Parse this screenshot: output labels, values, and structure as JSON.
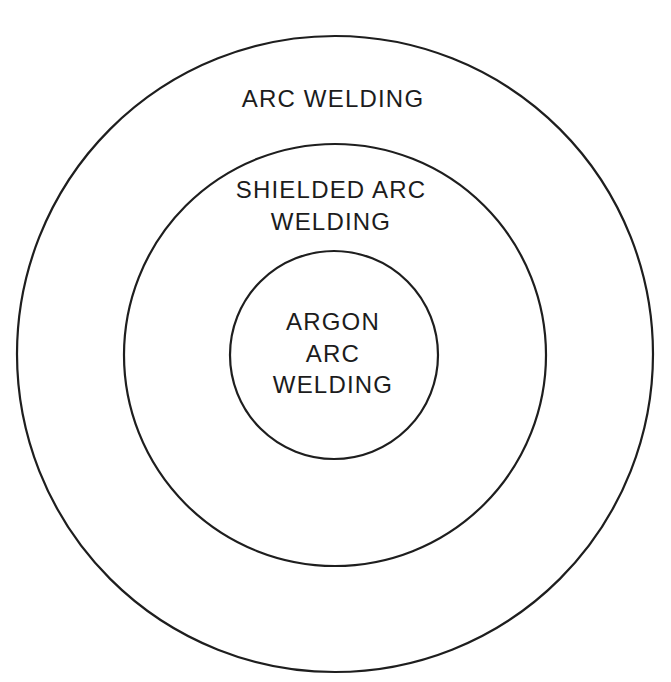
{
  "diagram": {
    "type": "concentric-circles",
    "stroke_color": "#1e1e1e",
    "text_color": "#1c1c1c",
    "background_color": "#ffffff",
    "circles": [
      {
        "id": "outer",
        "cx": 335,
        "cy": 354,
        "r": 318,
        "label_lines": [
          "ARC WELDING"
        ]
      },
      {
        "id": "middle",
        "cx": 335,
        "cy": 355,
        "r": 211,
        "label_lines": [
          "SHIELDED ARC",
          "WELDING"
        ]
      },
      {
        "id": "inner",
        "cx": 334,
        "cy": 355,
        "r": 104,
        "label_lines": [
          "ARGON",
          "ARC",
          "WELDING"
        ]
      }
    ]
  }
}
